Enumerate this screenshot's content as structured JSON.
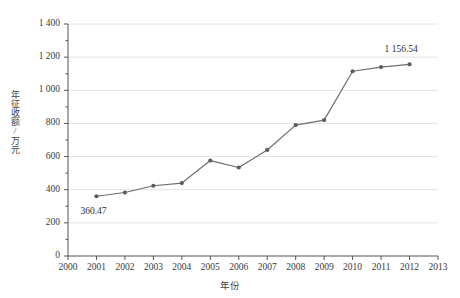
{
  "chart_data": {
    "type": "line",
    "title": "",
    "xlabel": "年份",
    "ylabel": "年征收额/万元",
    "categories": [
      2001,
      2002,
      2003,
      2004,
      2005,
      2006,
      2007,
      2008,
      2009,
      2010,
      2011,
      2012
    ],
    "values": [
      360.47,
      383,
      424,
      440,
      576,
      534,
      640,
      790,
      820,
      1115,
      1140,
      1156.54
    ],
    "x": [
      2001,
      2002,
      2003,
      2004,
      2005,
      2006,
      2007,
      2008,
      2009,
      2010,
      2011,
      2012
    ],
    "xlim": [
      2000,
      2013
    ],
    "ylim": [
      0,
      1400
    ],
    "xticks": [
      2000,
      2001,
      2002,
      2003,
      2004,
      2005,
      2006,
      2007,
      2008,
      2009,
      2010,
      2011,
      2012,
      2013
    ],
    "xtick_labels": [
      "2000",
      "2001",
      "2002",
      "2003",
      "2004",
      "2005",
      "2006",
      "2007",
      "2008",
      "2009",
      "2010",
      "2011",
      "2012",
      "2013"
    ],
    "yticks": [
      0,
      200,
      400,
      600,
      800,
      1000,
      1200,
      1400
    ],
    "ytick_labels": [
      "0",
      "200",
      "400",
      "600",
      "800",
      "1 000",
      "1 200",
      "1 400"
    ],
    "y_minor_ticks": [
      100,
      300,
      500,
      700,
      900,
      1100,
      1300
    ],
    "grid": "horizontal",
    "legend": "none",
    "annotations": [
      {
        "name": "first-point-label",
        "text": "360.47",
        "x": 2001,
        "y": 360.47
      },
      {
        "name": "last-point-label",
        "text": "1 156.54",
        "x": 2012,
        "y": 1156.54
      }
    ],
    "colors": {
      "line": "#6e6e6e",
      "marker": "#5d5d5d",
      "grid": "#e2e2e2",
      "axis": "#555555",
      "text": "#333333",
      "background": "#ffffff"
    },
    "marker": "circle",
    "line_width": 1.2
  }
}
